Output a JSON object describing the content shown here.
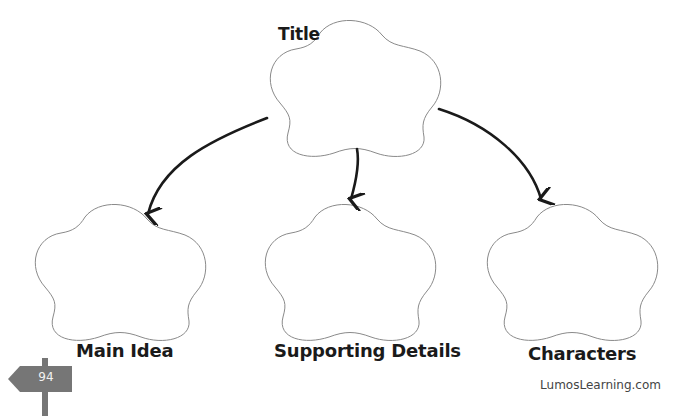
{
  "diagram": {
    "type": "graphic-organizer",
    "root": {
      "label": "Title",
      "shape": "flower-5-lobe",
      "bounds": {
        "x": 268,
        "y": 21,
        "w": 174,
        "h": 132
      }
    },
    "children": [
      {
        "label": "Main Idea",
        "shape": "flower-5-lobe",
        "bounds": {
          "x": 33,
          "y": 205,
          "w": 172,
          "h": 133
        }
      },
      {
        "label": "Supporting Details",
        "shape": "flower-5-lobe",
        "bounds": {
          "x": 263,
          "y": 205,
          "w": 174,
          "h": 133
        }
      },
      {
        "label": "Characters",
        "shape": "flower-5-lobe",
        "bounds": {
          "x": 485,
          "y": 205,
          "w": 172,
          "h": 133
        }
      }
    ],
    "edges": [
      {
        "from": "Title",
        "to": "Main Idea",
        "style": "curved-arrow"
      },
      {
        "from": "Title",
        "to": "Supporting Details",
        "style": "curved-arrow"
      },
      {
        "from": "Title",
        "to": "Characters",
        "style": "curved-arrow"
      }
    ]
  },
  "labels": {
    "title": "Title",
    "main_idea": "Main Idea",
    "supporting_details": "Supporting Details",
    "characters": "Characters"
  },
  "footer": {
    "page_number": "94",
    "brand": "LumosLearning.com"
  },
  "colors": {
    "outline": "#8a8a8a",
    "arrow": "#1a1a1a",
    "signpost": "#767676",
    "text": "#1a1a1a"
  }
}
